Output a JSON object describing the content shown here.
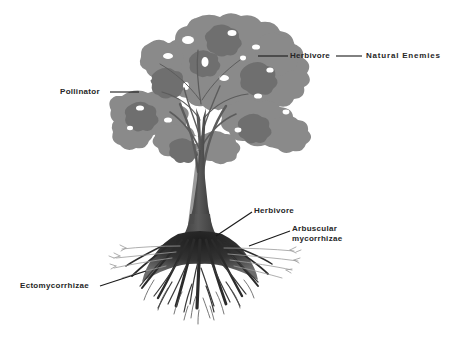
{
  "figure": {
    "background_color": "#ffffff",
    "canopy_color": "#8a8a8a",
    "canopy_shadow_color": "#6f6f6f",
    "trunk_color": "#4a4a4a",
    "root_color": "#2b2b2b",
    "fine_root_color": "#9a9a9a",
    "leader_line_color": "#1a1a1a",
    "text_color": "#262626"
  },
  "labels": {
    "herbivore_canopy": "Herbivore",
    "natural_enemies": "Natural Enemies",
    "pollinator": "Pollinator",
    "herbivore_root": "Herbivore",
    "arbuscular_line1": "Arbuscular",
    "arbuscular_line2": "mycorrhizae",
    "ectomycorrhizae": "Ectomycorrhizae"
  },
  "parts": {
    "canopy": "tree-canopy",
    "trunk": "tree-trunk",
    "roots": "root-system",
    "lateral_roots": "lateral-fine-roots"
  }
}
